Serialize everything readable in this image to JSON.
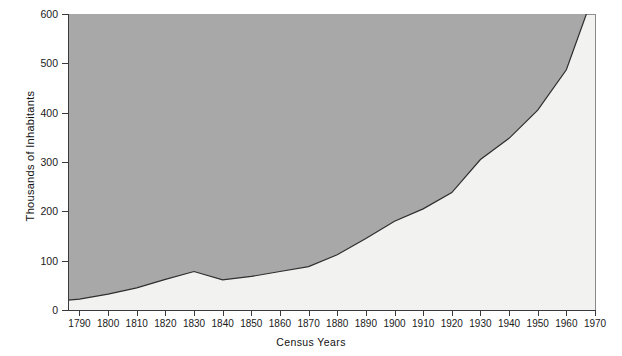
{
  "chart_data": {
    "type": "area",
    "title": "",
    "xlabel": "Census Years",
    "ylabel": "Thousands of Inhabitants",
    "xlim": [
      1786,
      1970
    ],
    "ylim": [
      0,
      600
    ],
    "grid": false,
    "legend": "none",
    "series_name": "Population",
    "x": [
      1786,
      1790,
      1800,
      1810,
      1820,
      1830,
      1840,
      1850,
      1860,
      1870,
      1880,
      1890,
      1900,
      1910,
      1920,
      1930,
      1940,
      1950,
      1960,
      1967
    ],
    "values": [
      20,
      22,
      32,
      45,
      62,
      78,
      61,
      68,
      78,
      88,
      112,
      145,
      180,
      205,
      238,
      305,
      348,
      405,
      487,
      600
    ],
    "xticks": [
      "1790",
      "1800",
      "1810",
      "1820",
      "1830",
      "1840",
      "1850",
      "1860",
      "1870",
      "1880",
      "1890",
      "1900",
      "1910",
      "1920",
      "1930",
      "1940",
      "1950",
      "1960",
      "1970"
    ],
    "yticks": [
      "0",
      "100",
      "200",
      "300",
      "400",
      "500",
      "600"
    ],
    "colors": {
      "upper_fill": "#a8a8a8",
      "lower_fill": "#f2f2f0",
      "curve": "#2e2e2e",
      "axis": "#3a3a3a",
      "text": "#1a1a1a"
    }
  }
}
